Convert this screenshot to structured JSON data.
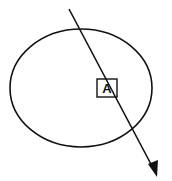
{
  "diagram": {
    "shapes": [
      {
        "type": "ellipse",
        "name": "orbit-ellipse",
        "cx": 81,
        "cy": 88,
        "rx": 71,
        "ry": 59
      },
      {
        "type": "arrow",
        "name": "trajectory-arrow",
        "from": [
          69,
          9
        ],
        "to": [
          157,
          176
        ]
      },
      {
        "type": "box",
        "name": "point-box",
        "x": 97,
        "y": 79,
        "w": 20,
        "h": 18
      }
    ],
    "labels": {
      "point": "A"
    },
    "colors": {
      "stroke": "#111111",
      "background": "#ffffff"
    }
  }
}
